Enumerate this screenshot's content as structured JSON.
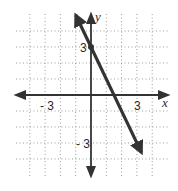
{
  "chart_data": {
    "type": "line",
    "title": "",
    "xlabel": "x",
    "ylabel": "y",
    "xlim": [
      -4.1,
      4.1
    ],
    "ylim": [
      -4.1,
      4.1
    ],
    "grid": true,
    "grid_style": "dotted",
    "x_tick_labels": [
      {
        "value": -3,
        "label": "- 3"
      },
      {
        "value": 3,
        "label": "3"
      }
    ],
    "y_tick_labels": [
      {
        "value": 3,
        "label": "3"
      },
      {
        "value": -3,
        "label": "- 3"
      }
    ],
    "series": [
      {
        "name": "line",
        "equation": "y = -2x + 3",
        "slope": -2,
        "intercept": 3,
        "x": [
          -1,
          0,
          1.5,
          3.3
        ],
        "y": [
          5,
          3,
          0,
          -3.6
        ],
        "arrows": "both",
        "marked_point": {
          "x": 0,
          "y": 3
        }
      }
    ],
    "colors": {
      "line": "#333333",
      "axes": "#333333",
      "grid": "#9a9a9a"
    }
  },
  "labels": {
    "x_axis": "x",
    "y_axis": "y",
    "x_neg3": "- 3",
    "x_pos3": "3",
    "y_pos3": "3",
    "y_neg3": "- 3"
  }
}
